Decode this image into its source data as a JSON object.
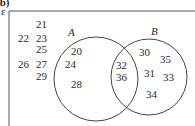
{
  "part_label": "(b)",
  "universal_symbol": "ε",
  "sets": [
    {
      "name": "A",
      "cx": 96,
      "cy": 79,
      "r": 42,
      "label_x": 68,
      "label_y": 36
    },
    {
      "name": "B",
      "cx": 149,
      "cy": 77,
      "r": 38,
      "label_x": 151,
      "label_y": 35
    }
  ],
  "regions": {
    "outside": [
      {
        "v": "21",
        "x": 36,
        "y": 28
      },
      {
        "v": "22",
        "x": 18,
        "y": 42
      },
      {
        "v": "23",
        "x": 36,
        "y": 42
      },
      {
        "v": "25",
        "x": 36,
        "y": 53
      },
      {
        "v": "26",
        "x": 18,
        "y": 68
      },
      {
        "v": "27",
        "x": 36,
        "y": 68
      },
      {
        "v": "29",
        "x": 36,
        "y": 80
      }
    ],
    "a_only": [
      {
        "v": "20",
        "x": 71,
        "y": 55
      },
      {
        "v": "24",
        "x": 65,
        "y": 68
      },
      {
        "v": "28",
        "x": 71,
        "y": 88
      }
    ],
    "a_and_b": [
      {
        "v": "32",
        "x": 116,
        "y": 69
      },
      {
        "v": "36",
        "x": 116,
        "y": 81
      }
    ],
    "b_only": [
      {
        "v": "30",
        "x": 139,
        "y": 56
      },
      {
        "v": "35",
        "x": 160,
        "y": 63
      },
      {
        "v": "31",
        "x": 144,
        "y": 77
      },
      {
        "v": "33",
        "x": 163,
        "y": 81
      },
      {
        "v": "34",
        "x": 146,
        "y": 98
      }
    ]
  }
}
